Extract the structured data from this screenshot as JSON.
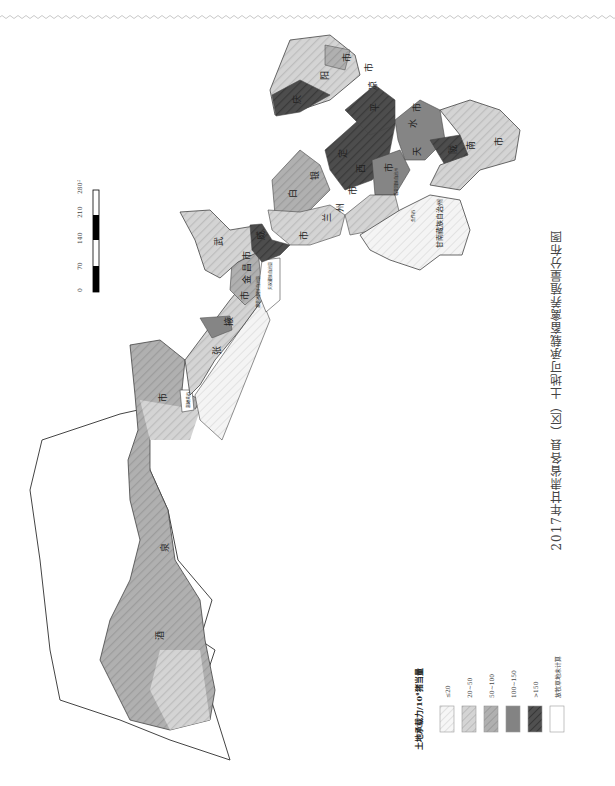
{
  "title": "2017年甘肃省各县（区）土地可承载畜禽养殖量分布图",
  "scale_bar": {
    "ticks": [
      "0",
      "70",
      "140",
      "210",
      "280"
    ],
    "unit": "千米"
  },
  "legend": {
    "title": "土地承载力/10⁴猪当量",
    "items": [
      {
        "label": "≤20",
        "color": "#f2f2f2",
        "pattern": "light-hatch"
      },
      {
        "label": "20~50",
        "color": "#cfcfcf",
        "pattern": "hatch"
      },
      {
        "label": "50~100",
        "color": "#a9a9a9",
        "pattern": "hatch"
      },
      {
        "label": "100~150",
        "color": "#7f7f7f",
        "pattern": "solid"
      },
      {
        "label": ">150",
        "color": "#4a4a4a",
        "pattern": "dark-hatch"
      },
      {
        "label": "放牧草地未计算",
        "color": "#ffffff",
        "pattern": "none"
      }
    ]
  },
  "regions": [
    {
      "name": "酒泉市",
      "chars": [
        "酒",
        "泉",
        "市"
      ],
      "class": "50~100"
    },
    {
      "name": "嘉峪关市",
      "class": "none"
    },
    {
      "name": "张掖市",
      "chars": [
        "张",
        "掖",
        "市"
      ],
      "class": "20~50"
    },
    {
      "name": "金昌市",
      "chars": [
        "金",
        "昌",
        "市"
      ],
      "class": "50~100"
    },
    {
      "name": "武威市",
      "chars": [
        "武",
        "威",
        "市"
      ],
      "class": "20~50"
    },
    {
      "name": "天祝藏族自治县",
      "class": "none"
    },
    {
      "name": "白银市",
      "chars": [
        "白",
        "银",
        "市"
      ],
      "class": "50~100"
    },
    {
      "name": "兰州市",
      "chars": [
        "兰",
        "州",
        "市"
      ],
      "class": "20~50"
    },
    {
      "name": "定西市",
      "chars": [
        "定",
        "西",
        "市"
      ],
      "class": ">150"
    },
    {
      "name": "临夏回族自治州",
      "class": "20~50"
    },
    {
      "name": "甘南藏族自治州",
      "class": "≤20"
    },
    {
      "name": "天水市",
      "chars": [
        "天",
        "水",
        "市"
      ],
      "class": "100~150"
    },
    {
      "name": "平凉市",
      "chars": [
        "平",
        "凉",
        "市"
      ],
      "class": ">150"
    },
    {
      "name": "庆阳市",
      "chars": [
        "庆",
        "阳",
        "市"
      ],
      "class": ">150"
    },
    {
      "name": "陇南市",
      "chars": [
        "陇",
        "南",
        "市"
      ],
      "class": "20~50"
    }
  ],
  "small_labels": {
    "jiayuguan": "嘉峪关市",
    "tianzhu": "天祝藏族自治县",
    "sunan": "肃南裕固族自治县",
    "linxia": "临夏回族自治州",
    "hezuo": "合作市",
    "gannan": "甘南藏族自治州"
  }
}
